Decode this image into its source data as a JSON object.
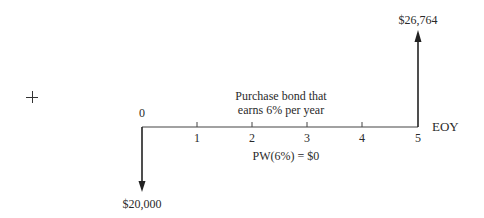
{
  "diagram": {
    "type": "cash-flow-diagram",
    "axis": {
      "label": "EOY",
      "ticks": [
        "0",
        "1",
        "2",
        "3",
        "4",
        "5"
      ]
    },
    "description": {
      "line1": "Purchase bond that",
      "line2": "earns 6% per year"
    },
    "present_worth": "PW(6%) = $0",
    "cash_flows": [
      {
        "period": "0",
        "direction": "down",
        "amount": "$20,000"
      },
      {
        "period": "5",
        "direction": "up",
        "amount": "$26,764"
      }
    ],
    "marker": "+"
  }
}
